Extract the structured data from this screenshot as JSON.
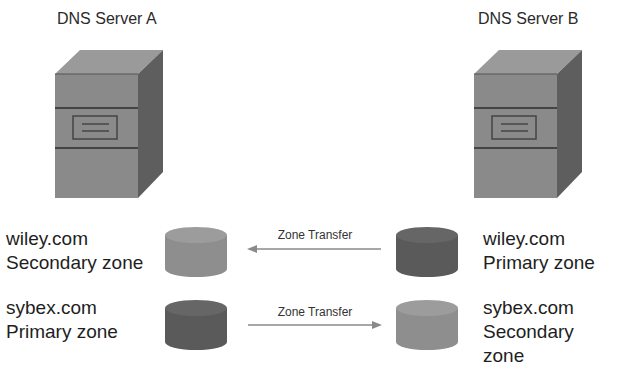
{
  "servers": [
    {
      "title": "DNS Server A"
    },
    {
      "title": "DNS Server B"
    }
  ],
  "zones": {
    "server_a": [
      {
        "domain": "wiley.com",
        "type": "Secondary zone",
        "color": "#8e8e8e"
      },
      {
        "domain": "sybex.com",
        "type": "Primary zone",
        "color": "#5a5a5a"
      }
    ],
    "server_b": [
      {
        "domain": "wiley.com",
        "type": "Primary zone",
        "color": "#5a5a5a"
      },
      {
        "domain": "sybex.com",
        "type": "Secondary zone",
        "color": "#8e8e8e"
      }
    ]
  },
  "transfers": [
    {
      "label": "Zone Transfer",
      "direction": "B-to-A",
      "zone": "wiley.com"
    },
    {
      "label": "Zone Transfer",
      "direction": "A-to-B",
      "zone": "sybex.com"
    }
  ],
  "colors": {
    "server_front": "#8a8a8a",
    "server_top": "#9a9a9a",
    "server_side": "#5e5e5e",
    "arrow": "#8a8a8a"
  }
}
